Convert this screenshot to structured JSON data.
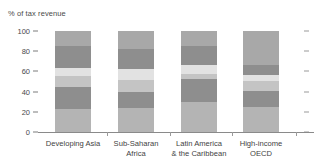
{
  "chart_data": {
    "type": "bar",
    "subtype": "stacked-bar",
    "title": "",
    "xlabel": "",
    "ylabel": "% of tax revenue",
    "ylim": [
      0,
      100
    ],
    "yticks": [
      0,
      20,
      40,
      60,
      80,
      100
    ],
    "ytick_labels": [
      "0",
      "20",
      "40",
      "60",
      "80",
      "100"
    ],
    "grid": false,
    "legend": "none",
    "right_axis_ticks": true,
    "categories": [
      "Developing Asia",
      "Sub-Saharan Africa",
      "Latin America & the Caribbean",
      "High-income OECD"
    ],
    "category_lines": [
      [
        "Developing Asia"
      ],
      [
        "Sub-Saharan",
        "Africa"
      ],
      [
        "Latin America",
        "& the Caribbean"
      ],
      [
        "High-income",
        "OECD"
      ]
    ],
    "series": [
      {
        "name": "segment-1",
        "color": "#b4b4b4",
        "values": [
          23,
          24,
          30,
          25
        ]
      },
      {
        "name": "segment-2",
        "color": "#8e8e8e",
        "values": [
          22,
          16,
          22,
          16
        ]
      },
      {
        "name": "segment-3",
        "color": "#c4c4c4",
        "values": [
          10,
          12,
          5,
          10
        ]
      },
      {
        "name": "segment-4",
        "color": "#e2e2e2",
        "values": [
          8,
          10,
          9,
          5
        ]
      },
      {
        "name": "segment-5",
        "color": "#8e8e8e",
        "values": [
          22,
          20,
          19,
          10
        ]
      },
      {
        "name": "segment-6",
        "color": "#a8a8a8",
        "values": [
          15,
          18,
          15,
          34
        ]
      }
    ],
    "totals": [
      100,
      100,
      100,
      100
    ],
    "colors": {
      "axis": "#8a8a8a",
      "tick": "#9a9a9a",
      "text": "#3f3f3f",
      "background": "#ffffff"
    }
  }
}
